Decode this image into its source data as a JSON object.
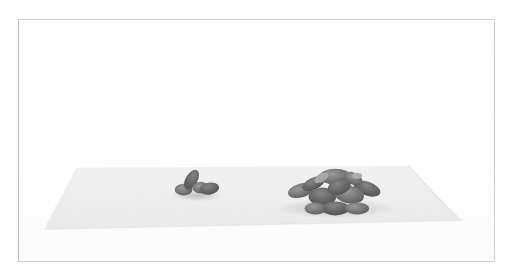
{
  "image": {
    "description": "Grayscale photograph of two piles of nuts on a woven fabric mat against a white backdrop",
    "style": "grayscale",
    "frame_color": "#cfcfcf",
    "background_color": "#ffffff",
    "mat_color": "#eeeeee",
    "pile_color": "#6f6f6f"
  },
  "objects": [
    {
      "name": "woven-mat",
      "label": "Woven fabric mat"
    },
    {
      "name": "small-pile",
      "label": "Small pile of nuts",
      "count_estimate": 4
    },
    {
      "name": "large-pile",
      "label": "Large pile of nuts",
      "count_estimate": 14
    }
  ]
}
